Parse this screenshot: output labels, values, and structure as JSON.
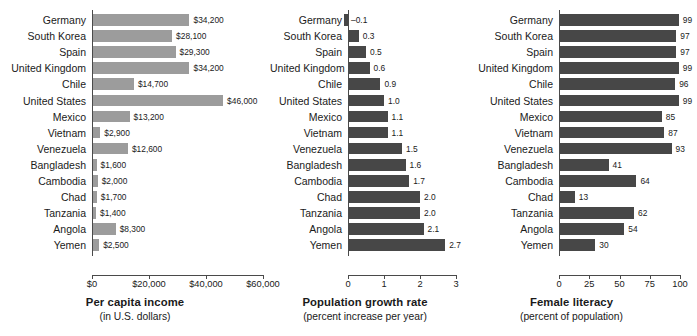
{
  "countries": [
    "Germany",
    "South Korea",
    "Spain",
    "United Kingdom",
    "Chile",
    "United States",
    "Mexico",
    "Vietnam",
    "Venezuela",
    "Bangladesh",
    "Cambodia",
    "Chad",
    "Tanzania",
    "Angola",
    "Yemen"
  ],
  "colors": {
    "light_bar": "#9c9c9c",
    "dark_bar": "#474747",
    "axis": "#4a4a4a",
    "text": "#1a1a1a",
    "background": "#ffffff"
  },
  "chart_data": [
    {
      "type": "bar",
      "orientation": "horizontal",
      "id": "per-capita-income",
      "title": "Per capita income",
      "subtitle": "(in U.S. dollars)",
      "xlabel": "",
      "ylabel": "",
      "xlim": [
        0,
        60000
      ],
      "grid": false,
      "legend": null,
      "bar_color": "#9c9c9c",
      "tick_values": [
        0,
        20000,
        40000,
        60000
      ],
      "tick_labels": [
        "$0",
        "$20,000",
        "$40,000",
        "$60,000"
      ],
      "categories": [
        "Germany",
        "South Korea",
        "Spain",
        "United Kingdom",
        "Chile",
        "United States",
        "Mexico",
        "Vietnam",
        "Venezuela",
        "Bangladesh",
        "Cambodia",
        "Chad",
        "Tanzania",
        "Angola",
        "Yemen"
      ],
      "values": [
        34200,
        28100,
        29300,
        34200,
        14700,
        46000,
        13200,
        2900,
        12600,
        1600,
        2000,
        1700,
        1400,
        8300,
        2500
      ],
      "data_labels": [
        "$34,200",
        "$28,100",
        "$29,300",
        "$34,200",
        "$14,700",
        "$46,000",
        "$13,200",
        "$2,900",
        "$12,600",
        "$1,600",
        "$2,000",
        "$1,700",
        "$1,400",
        "$8,300",
        "$2,500"
      ]
    },
    {
      "type": "bar",
      "orientation": "horizontal",
      "id": "population-growth-rate",
      "title": "Population growth rate",
      "subtitle": "(percent increase per year)",
      "xlabel": "",
      "ylabel": "",
      "xlim": [
        0,
        3
      ],
      "grid": false,
      "legend": null,
      "bar_color": "#474747",
      "tick_values": [
        0,
        1,
        2,
        3
      ],
      "tick_labels": [
        "0",
        "1",
        "2",
        "3"
      ],
      "categories": [
        "Germany",
        "South Korea",
        "Spain",
        "United Kingdom",
        "Chile",
        "United States",
        "Mexico",
        "Vietnam",
        "Venezuela",
        "Bangladesh",
        "Cambodia",
        "Chad",
        "Tanzania",
        "Angola",
        "Yemen"
      ],
      "values": [
        -0.1,
        0.3,
        0.5,
        0.6,
        0.9,
        1.0,
        1.1,
        1.1,
        1.5,
        1.6,
        1.7,
        2.0,
        2.0,
        2.1,
        2.7
      ],
      "data_labels": [
        "–0.1",
        "0.3",
        "0.5",
        "0.6",
        "0.9",
        "1.0",
        "1.1",
        "1.1",
        "1.5",
        "1.6",
        "1.7",
        "2.0",
        "2.0",
        "2.1",
        "2.7"
      ]
    },
    {
      "type": "bar",
      "orientation": "horizontal",
      "id": "female-literacy",
      "title": "Female literacy",
      "subtitle": "(percent of population)",
      "xlabel": "",
      "ylabel": "",
      "xlim": [
        0,
        100
      ],
      "grid": false,
      "legend": null,
      "bar_color": "#474747",
      "tick_values": [
        0,
        25,
        50,
        75,
        100
      ],
      "tick_labels": [
        "0",
        "25",
        "50",
        "75",
        "100"
      ],
      "categories": [
        "Germany",
        "South Korea",
        "Spain",
        "United Kingdom",
        "Chile",
        "United States",
        "Mexico",
        "Vietnam",
        "Venezuela",
        "Bangladesh",
        "Cambodia",
        "Chad",
        "Tanzania",
        "Angola",
        "Yemen"
      ],
      "values": [
        99,
        97,
        97,
        99,
        96,
        99,
        85,
        87,
        93,
        41,
        64,
        13,
        62,
        54,
        30
      ],
      "data_labels": [
        "99",
        "97",
        "97",
        "99",
        "96",
        "99",
        "85",
        "87",
        "93",
        "41",
        "64",
        "13",
        "62",
        "54",
        "30"
      ]
    }
  ]
}
